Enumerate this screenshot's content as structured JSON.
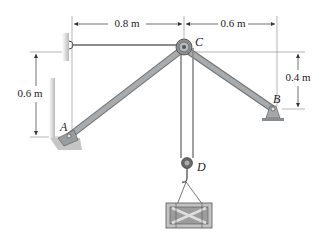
{
  "diagram": {
    "type": "statics-frame",
    "dimensions": {
      "top_left": "0.8 m",
      "top_right": "0.6 m",
      "left_vertical": "0.6 m",
      "right_vertical": "0.4 m"
    },
    "points": {
      "A": "A",
      "B": "B",
      "C": "C",
      "D": "D"
    },
    "colors": {
      "member": "#a8abad",
      "member_edge": "#6f7274",
      "wall": "#c9c9c9",
      "crate": "#bdbdbd",
      "line": "#333333"
    }
  }
}
